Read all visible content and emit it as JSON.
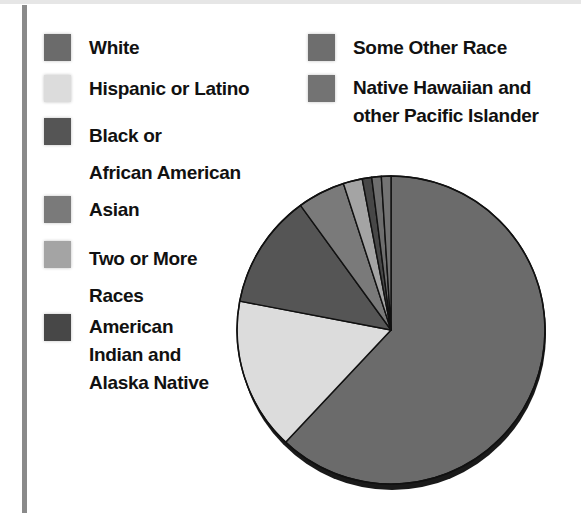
{
  "legend": {
    "left": [
      {
        "label": "White",
        "color": "#6b6b6b"
      },
      {
        "label": "Hispanic or Latino",
        "color": "#dcdcdc"
      },
      {
        "label": "Black or\nAfrican American",
        "color": "#555555"
      },
      {
        "label": "Asian",
        "color": "#7a7a7a"
      },
      {
        "label": "Two or More\nRaces",
        "color": "#a4a4a4"
      },
      {
        "label": "American\nIndian and\nAlaska Native",
        "color": "#474747"
      }
    ],
    "right": [
      {
        "label": "Some Other Race",
        "color": "#6e6e6e"
      },
      {
        "label": "Native Hawaiian and\nother Pacific Islander",
        "color": "#737373"
      }
    ]
  },
  "chart_data": {
    "type": "pie",
    "title": "",
    "start_angle": "12 o'clock, clockwise",
    "categories": [
      "White",
      "Hispanic or Latino",
      "Black or African American",
      "Asian",
      "Two or More Races",
      "American Indian and Alaska Native",
      "Some Other Race",
      "Native Hawaiian and other Pacific Islander"
    ],
    "values": [
      62,
      16,
      12,
      5,
      2,
      1,
      1,
      1
    ],
    "colors": [
      "#6b6b6b",
      "#dcdcdc",
      "#555555",
      "#7a7a7a",
      "#a4a4a4",
      "#474747",
      "#6e6e6e",
      "#737373"
    ],
    "slice_order_clockwise_from_top": [
      "White",
      "Hispanic or Latino",
      "Black or African American",
      "Asian",
      "Two or More Races",
      "American Indian and Alaska Native",
      "Some Other Race",
      "Native Hawaiian and other Pacific Islander"
    ],
    "data_labels": false,
    "legend_position": "top-left, two columns"
  }
}
